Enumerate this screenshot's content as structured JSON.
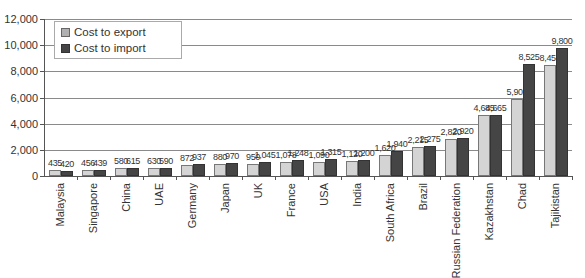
{
  "chart_data": {
    "type": "bar",
    "title": "",
    "xlabel": "",
    "ylabel": "",
    "ylim": [
      0,
      12000
    ],
    "yticks": [
      "0",
      "2,000",
      "4,000",
      "6,000",
      "8,000",
      "10,000",
      "12,000"
    ],
    "ytick_values": [
      0,
      2000,
      4000,
      6000,
      8000,
      10000,
      12000
    ],
    "grid": true,
    "legend_position": "upper-left",
    "categories": [
      "Malaysia",
      "Singapore",
      "China",
      "UAE",
      "Germany",
      "Japan",
      "UK",
      "France",
      "USA",
      "India",
      "South Africa",
      "Brazil",
      "Russian Federation",
      "Kazakhstan",
      "Chad",
      "Tajikistan"
    ],
    "series": [
      {
        "name": "Cost to export",
        "color": "#d4d4d4",
        "values": [
          435,
          456,
          580,
          630,
          872,
          880,
          950,
          1078,
          1090,
          1120,
          1620,
          2215,
          2820,
          4685,
          5902,
          8450
        ],
        "labels": [
          "435",
          "456",
          "580",
          "630",
          "872",
          "880",
          "950",
          "1,078",
          "1,090",
          "1,120",
          "1,620",
          "2,215",
          "2,820",
          "4,685",
          "5,902",
          "8,450"
        ]
      },
      {
        "name": "Cost to import",
        "color": "#454545",
        "values": [
          420,
          439,
          615,
          590,
          937,
          970,
          1045,
          1248,
          1315,
          1200,
          1940,
          2275,
          2920,
          4665,
          8525,
          9800
        ],
        "labels": [
          "420",
          "439",
          "615",
          "590",
          "937",
          "970",
          "1,045",
          "1,248",
          "1,315",
          "1,200",
          "1,940",
          "2,275",
          "2,920",
          "4,665",
          "8,525",
          "9,800"
        ]
      }
    ]
  },
  "legend": {
    "export_label": "Cost to export",
    "import_label": "Cost to import"
  }
}
